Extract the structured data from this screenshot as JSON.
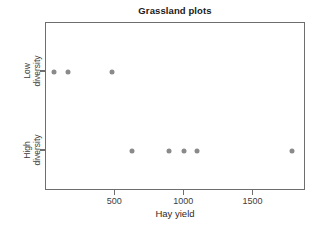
{
  "chart_data": {
    "type": "scatter",
    "title": "Grassland plots",
    "xlabel": "Hay yield",
    "ylabel": "",
    "xlim": [
      0,
      1880
    ],
    "xticks": [
      500,
      1000,
      1500
    ],
    "xtick_labels": [
      "500",
      "1000",
      "1500"
    ],
    "ycategories": [
      "Low diversity",
      "High diversity"
    ],
    "ytick_labels": [
      "Low\ndiversity",
      "High\ndiversity"
    ],
    "grid": false,
    "legend": false,
    "marker_color": "#8a8a8a",
    "axis_color": "#6e6e6e",
    "series": [
      {
        "name": "Low diversity",
        "category": "Low diversity",
        "values": [
          60,
          160,
          475
        ]
      },
      {
        "name": "High diversity",
        "category": "High diversity",
        "values": [
          625,
          890,
          995,
          1095,
          1780
        ]
      }
    ],
    "points": [
      {
        "x": 60,
        "y": "Low diversity"
      },
      {
        "x": 160,
        "y": "Low diversity"
      },
      {
        "x": 475,
        "y": "Low diversity"
      },
      {
        "x": 625,
        "y": "High diversity"
      },
      {
        "x": 890,
        "y": "High diversity"
      },
      {
        "x": 995,
        "y": "High diversity"
      },
      {
        "x": 1095,
        "y": "High diversity"
      },
      {
        "x": 1780,
        "y": "High diversity"
      }
    ]
  }
}
